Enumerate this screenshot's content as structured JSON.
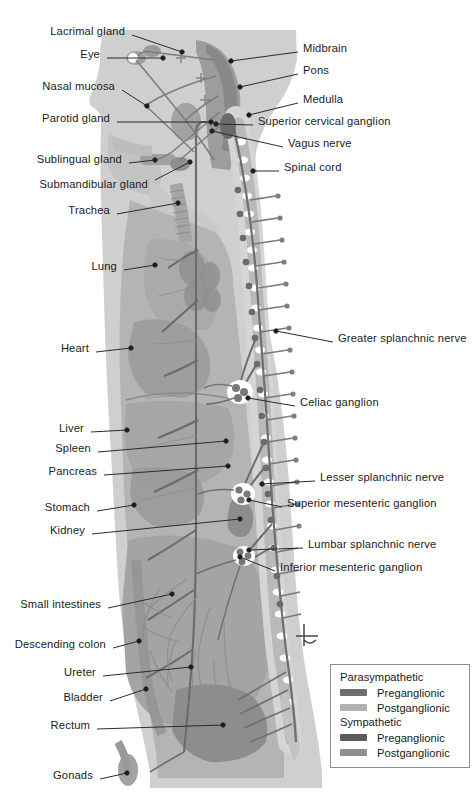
{
  "figure": {
    "caption": "",
    "background": "#ffffff"
  },
  "palette": {
    "body_outer": "#cfcfcf",
    "body_inner": "#b4b4b4",
    "organ_mid": "#a8a8a8",
    "organ_dark": "#8f8f8f",
    "cord_light": "#d8d8d8",
    "cord_white": "#ffffff",
    "nerve_dark": "#6e6e6e",
    "nerve_mid": "#8a8a8a",
    "nerve_light": "#b0b0b0",
    "leader_line": "#2b2b2b",
    "text": "#1a1a1a"
  },
  "labels_left": [
    {
      "id": "lacrimal-gland",
      "text": "Lacrimal gland",
      "tx": 125,
      "ty": 31,
      "lx": 132,
      "ly": 35,
      "ax": 182,
      "ay": 52
    },
    {
      "id": "eye",
      "text": "Eye",
      "tx": 100,
      "ty": 54,
      "lx": 107,
      "ly": 58,
      "ax": 163,
      "ay": 58
    },
    {
      "id": "nasal-mucosa",
      "text": "Nasal mucosa",
      "tx": 115,
      "ty": 86,
      "lx": 122,
      "ly": 90,
      "ax": 147,
      "ay": 106
    },
    {
      "id": "parotid-gland",
      "text": "Parotid gland",
      "tx": 110,
      "ty": 118,
      "lx": 117,
      "ly": 122,
      "ax": 211,
      "ay": 122
    },
    {
      "id": "sublingual-gland",
      "text": "Sublingual gland",
      "tx": 122,
      "ty": 159,
      "lx": 129,
      "ly": 163,
      "ax": 155,
      "ay": 160
    },
    {
      "id": "submandibular-gland",
      "text": "Submandibular gland",
      "tx": 148,
      "ty": 184,
      "lx": 155,
      "ly": 180,
      "ax": 190,
      "ay": 162
    },
    {
      "id": "trachea",
      "text": "Trachea",
      "tx": 110,
      "ty": 210,
      "lx": 117,
      "ly": 214,
      "ax": 178,
      "ay": 203
    },
    {
      "id": "lung",
      "text": "Lung",
      "tx": 117,
      "ty": 266,
      "lx": 124,
      "ly": 270,
      "ax": 155,
      "ay": 265
    },
    {
      "id": "heart",
      "text": "Heart",
      "tx": 89,
      "ty": 348,
      "lx": 96,
      "ly": 352,
      "ax": 131,
      "ay": 348
    },
    {
      "id": "liver",
      "text": "Liver",
      "tx": 84,
      "ty": 428,
      "lx": 91,
      "ly": 432,
      "ax": 127,
      "ay": 430
    },
    {
      "id": "spleen",
      "text": "Spleen",
      "tx": 91,
      "ty": 448,
      "lx": 98,
      "ly": 452,
      "ax": 226,
      "ay": 441
    },
    {
      "id": "pancreas",
      "text": "Pancreas",
      "tx": 97,
      "ty": 471,
      "lx": 104,
      "ly": 475,
      "ax": 228,
      "ay": 466
    },
    {
      "id": "stomach",
      "text": "Stomach",
      "tx": 90,
      "ty": 507,
      "lx": 97,
      "ly": 511,
      "ax": 134,
      "ay": 505
    },
    {
      "id": "kidney",
      "text": "Kidney",
      "tx": 85,
      "ty": 530,
      "lx": 92,
      "ly": 534,
      "ax": 240,
      "ay": 519
    },
    {
      "id": "small-intestines",
      "text": "Small intestines",
      "tx": 101,
      "ty": 604,
      "lx": 108,
      "ly": 608,
      "ax": 172,
      "ay": 594
    },
    {
      "id": "descending-colon",
      "text": "Descending colon",
      "tx": 106,
      "ty": 644,
      "lx": 113,
      "ly": 648,
      "ax": 139,
      "ay": 641
    },
    {
      "id": "ureter",
      "text": "Ureter",
      "tx": 96,
      "ty": 672,
      "lx": 103,
      "ly": 676,
      "ax": 191,
      "ay": 667
    },
    {
      "id": "bladder",
      "text": "Bladder",
      "tx": 103,
      "ty": 697,
      "lx": 110,
      "ly": 701,
      "ax": 146,
      "ay": 689
    },
    {
      "id": "rectum",
      "text": "Rectum",
      "tx": 90,
      "ty": 725,
      "lx": 97,
      "ly": 729,
      "ax": 223,
      "ay": 725
    },
    {
      "id": "gonads",
      "text": "Gonads",
      "tx": 93,
      "ty": 775,
      "lx": 100,
      "ly": 779,
      "ax": 127,
      "ay": 773
    }
  ],
  "labels_right": [
    {
      "id": "midbrain",
      "text": "Midbrain",
      "tx": 303,
      "ty": 48,
      "lx": 298,
      "ly": 52,
      "ax": 231,
      "ay": 61
    },
    {
      "id": "pons",
      "text": "Pons",
      "tx": 303,
      "ty": 70,
      "lx": 298,
      "ly": 74,
      "ax": 240,
      "ay": 87
    },
    {
      "id": "medulla",
      "text": "Medulla",
      "tx": 303,
      "ty": 99,
      "lx": 298,
      "ly": 103,
      "ax": 249,
      "ay": 115
    },
    {
      "id": "superior-cervical-ganglion",
      "text": "Superior cervical ganglion",
      "tx": 258,
      "ty": 121,
      "lx": 253,
      "ly": 125,
      "ax": 216,
      "ay": 124
    },
    {
      "id": "vagus-nerve",
      "text": "Vagus nerve",
      "tx": 288,
      "ty": 143,
      "lx": 283,
      "ly": 147,
      "ax": 212,
      "ay": 131
    },
    {
      "id": "spinal-cord",
      "text": "Spinal cord",
      "tx": 284,
      "ty": 167,
      "lx": 279,
      "ly": 171,
      "ax": 253,
      "ay": 171
    },
    {
      "id": "greater-splanchnic-nerve",
      "text": "Greater splanchnic nerve",
      "tx": 338,
      "ty": 338,
      "lx": 333,
      "ly": 342,
      "ax": 276,
      "ay": 331
    },
    {
      "id": "celiac-ganglion",
      "text": "Celiac ganglion",
      "tx": 300,
      "ty": 402,
      "lx": 295,
      "ly": 406,
      "ax": 248,
      "ay": 398
    },
    {
      "id": "lesser-splanchnic-nerve",
      "text": "Lesser splanchnic nerve",
      "tx": 320,
      "ty": 477,
      "lx": 315,
      "ly": 481,
      "ax": 262,
      "ay": 484
    },
    {
      "id": "superior-mesenteric-ganglion",
      "text": "Superior mesenteric ganglion",
      "tx": 287,
      "ty": 503,
      "lx": 282,
      "ly": 507,
      "ax": 249,
      "ay": 500
    },
    {
      "id": "lumbar-splanchnic-nerve",
      "text": "Lumbar splanchnic nerve",
      "tx": 308,
      "ty": 544,
      "lx": 303,
      "ly": 548,
      "ax": 249,
      "ay": 550
    },
    {
      "id": "inferior-mesenteric-ganglion",
      "text": "Inferior mesenteric ganglion",
      "tx": 280,
      "ty": 567,
      "lx": 275,
      "ly": 571,
      "ax": 240,
      "ay": 557
    }
  ],
  "legend": {
    "groups": [
      {
        "id": "parasympathetic",
        "title": "Parasympathetic",
        "rows": [
          {
            "id": "para-pre",
            "label": "Preganglionic",
            "color": "#6e6e6e"
          },
          {
            "id": "para-post",
            "label": "Postganglionic",
            "color": "#b2b2b2"
          }
        ]
      },
      {
        "id": "sympathetic",
        "title": "Sympathetic",
        "rows": [
          {
            "id": "symp-pre",
            "label": "Preganglionic",
            "color": "#5b5b5b"
          },
          {
            "id": "symp-post",
            "label": "Postganglionic",
            "color": "#8f8f8f"
          }
        ]
      }
    ]
  }
}
